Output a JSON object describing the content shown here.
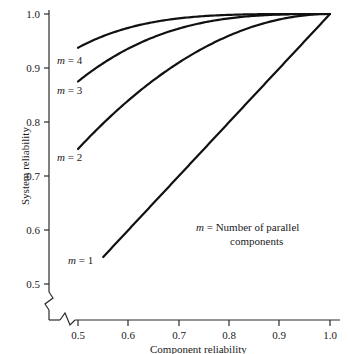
{
  "chart_data": {
    "type": "line",
    "title": "",
    "xlabel": "Component reliability",
    "ylabel": "System reliability",
    "xlim": [
      0.5,
      1.0
    ],
    "ylim": [
      0.5,
      1.01
    ],
    "grid": false,
    "axis_break_x": true,
    "axis_break_y": true,
    "legend_position": "inside-lower-right",
    "legend_note_line1": "= Number of parallel",
    "legend_note_line2": "components",
    "legend_note_symbol": "m",
    "xticks": [
      "0.5",
      "0.6",
      "0.7",
      "0.8",
      "0.9",
      "1.0"
    ],
    "xtick_values": [
      0.5,
      0.6,
      0.7,
      0.8,
      0.9,
      1.0
    ],
    "yticks": [
      "0.5",
      "0.6",
      "0.7",
      "0.8",
      "0.9",
      "1.0"
    ],
    "ytick_values": [
      0.5,
      0.6,
      0.7,
      0.8,
      0.9,
      1.0
    ],
    "formula": "R = 1 - (1 - r)^m",
    "series": [
      {
        "name": "m = 1",
        "label_symbol": "m",
        "label_text": "= 1",
        "m": 1,
        "x": [
          0.55,
          0.6,
          0.65,
          0.7,
          0.75,
          0.8,
          0.85,
          0.9,
          0.95,
          1.0
        ],
        "values": [
          0.55,
          0.6,
          0.65,
          0.7,
          0.75,
          0.8,
          0.85,
          0.9,
          0.95,
          1.0
        ]
      },
      {
        "name": "m = 2",
        "label_symbol": "m",
        "label_text": "= 2",
        "m": 2,
        "x": [
          0.5,
          0.55,
          0.6,
          0.65,
          0.7,
          0.75,
          0.8,
          0.85,
          0.9,
          0.95,
          1.0
        ],
        "values": [
          0.75,
          0.798,
          0.84,
          0.878,
          0.91,
          0.938,
          0.96,
          0.978,
          0.99,
          0.998,
          1.0
        ]
      },
      {
        "name": "m = 3",
        "label_symbol": "m",
        "label_text": "= 3",
        "m": 3,
        "x": [
          0.5,
          0.55,
          0.6,
          0.65,
          0.7,
          0.75,
          0.8,
          0.85,
          0.9,
          0.95,
          1.0
        ],
        "values": [
          0.875,
          0.909,
          0.936,
          0.957,
          0.973,
          0.984,
          0.992,
          0.997,
          0.999,
          1.0,
          1.0
        ]
      },
      {
        "name": "m = 4",
        "label_symbol": "m",
        "label_text": "= 4",
        "m": 4,
        "x": [
          0.5,
          0.55,
          0.6,
          0.65,
          0.7,
          0.75,
          0.8,
          0.85,
          0.9,
          0.95,
          1.0
        ],
        "values": [
          0.9375,
          0.959,
          0.974,
          0.985,
          0.992,
          0.996,
          0.998,
          1.0,
          1.0,
          1.0,
          1.0
        ]
      }
    ],
    "curve_label_positions": [
      {
        "name": "m = 1",
        "left": 68,
        "top": 255
      },
      {
        "name": "m = 2",
        "left": 57,
        "top": 152
      },
      {
        "name": "m = 3",
        "left": 57,
        "top": 85
      },
      {
        "name": "m = 4",
        "left": 57,
        "top": 55
      }
    ],
    "colors": {
      "line": "#111111",
      "axis": "#2a2a2a",
      "text": "#1a1a1a",
      "background": "#ffffff"
    }
  }
}
